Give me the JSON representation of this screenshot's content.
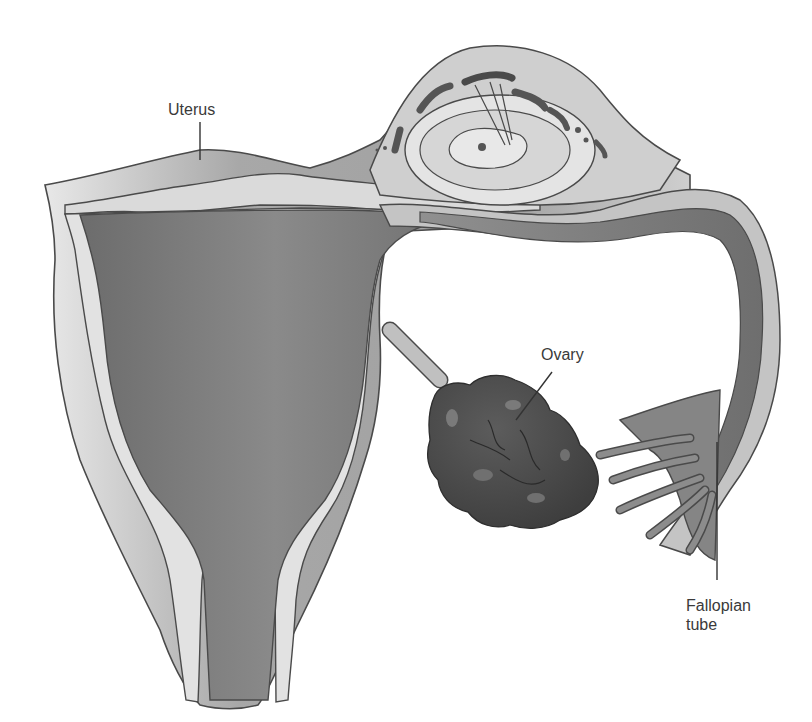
{
  "diagram": {
    "colors": {
      "outline": "#4a4a4a",
      "outer_wall": "#b8b8b8",
      "light_layer": "#dcdcdc",
      "cavity": "#7a7a7a",
      "ovary": "#4e4e4e",
      "tube_dark": "#8a8a8a",
      "background": "#ffffff"
    },
    "labels": {
      "uterus": "Uterus",
      "ovary": "Ovary",
      "fallopian_tube": "Fallopian\ntube"
    }
  }
}
